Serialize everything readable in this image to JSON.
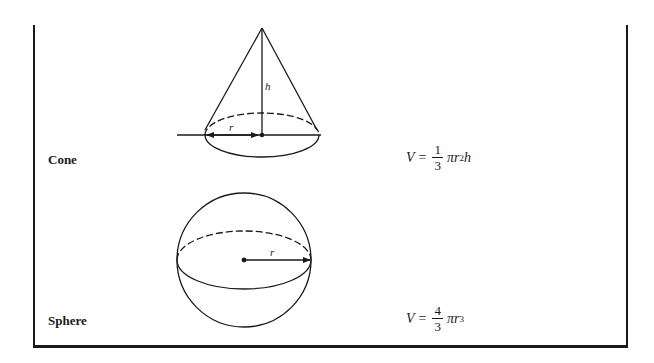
{
  "figure": {
    "rows": [
      {
        "id": "cone",
        "label": "Cone",
        "formula": {
          "lhs": "V",
          "equals": "=",
          "fraction": {
            "numerator": "1",
            "denominator": "3"
          },
          "pi": "π",
          "base": "r",
          "exponent": "2",
          "trailing": "h",
          "text": "V = (1/3) π r² h"
        },
        "diagram_labels": {
          "height": "h",
          "radius": "r"
        }
      },
      {
        "id": "sphere",
        "label": "Sphere",
        "formula": {
          "lhs": "V",
          "equals": "=",
          "fraction": {
            "numerator": "4",
            "denominator": "3"
          },
          "pi": "π",
          "base": "r",
          "exponent": "3",
          "trailing": "",
          "text": "V = (4/3) π r³"
        },
        "diagram_labels": {
          "radius": "r"
        }
      }
    ],
    "colors": {
      "ink": "#1a1a1a",
      "background": "#ffffff"
    }
  }
}
